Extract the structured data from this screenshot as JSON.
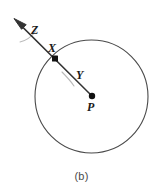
{
  "figure": {
    "caption": "(b)",
    "background_color": "#ffffff",
    "stroke_color": "#4a4a4a",
    "ray_color": "#333333",
    "label_color": "#1a1a1a",
    "arc_color": "#b9b9b9",
    "labels": {
      "tangent_ray": "Z",
      "point_on_circle": "X",
      "radius_segment": "Y",
      "center_point": "P"
    },
    "geometry": {
      "circle": {
        "center_x": 91.5,
        "center_y": 96.5,
        "radius": 56.5
      },
      "center_dot": {
        "x": 92,
        "y": 96,
        "radius": 3.2
      },
      "circle_point_dot": {
        "x": 55,
        "y": 58.5,
        "size": 6
      },
      "ray": {
        "from_x": 92,
        "from_y": 96,
        "through_x": 55,
        "through_y": 58.5,
        "arrow_tip_x": 14,
        "arrow_tip_y": 18.5
      }
    }
  }
}
